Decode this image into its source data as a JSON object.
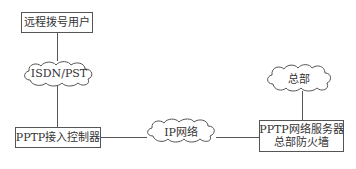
{
  "diagram": {
    "nodes": {
      "remote_user": {
        "label": "远程拨号用户",
        "shape": "rectangle"
      },
      "isdn_cloud": {
        "label": "ISDN/PST",
        "shape": "cloud"
      },
      "pptp_controller": {
        "label": "PPTP接入控制器",
        "shape": "rectangle"
      },
      "ip_cloud": {
        "label": "IP网络",
        "shape": "cloud"
      },
      "hq_cloud": {
        "label": "总部",
        "shape": "cloud"
      },
      "pptp_server": {
        "line1": "PPTP网络服务器",
        "line2": "总部防火墙",
        "shape": "rectangle"
      }
    },
    "edges": [
      {
        "from": "remote_user",
        "to": "isdn_cloud"
      },
      {
        "from": "isdn_cloud",
        "to": "pptp_controller"
      },
      {
        "from": "pptp_controller",
        "to": "ip_cloud"
      },
      {
        "from": "ip_cloud",
        "to": "pptp_server"
      },
      {
        "from": "hq_cloud",
        "to": "pptp_server"
      }
    ],
    "colors": {
      "stroke": "#555555",
      "text": "#333333",
      "background": "#ffffff"
    }
  }
}
